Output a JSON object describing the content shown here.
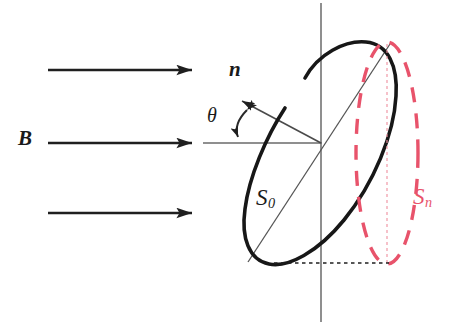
{
  "figure": {
    "background_color": "#ffffff",
    "width": 453,
    "height": 325
  },
  "colors": {
    "stroke_black": "#1a1a1a",
    "stroke_red": "#e8536b",
    "axis_gray": "#5a5a5a",
    "thin_line": "#555555"
  },
  "labels": {
    "field": "B",
    "normal": "n",
    "angle": "θ",
    "area_loop": "S",
    "area_loop_sub": "0",
    "area_projected": "S",
    "area_projected_sub": "n"
  },
  "field_arrows": [
    {
      "name": "field-arrow-top",
      "x1": 48,
      "y1": 70,
      "x2": 205,
      "y2": 70
    },
    {
      "name": "field-arrow-middle",
      "x1": 48,
      "y1": 143,
      "x2": 205,
      "y2": 143
    },
    {
      "name": "field-arrow-bottom",
      "x1": 48,
      "y1": 213,
      "x2": 205,
      "y2": 213
    }
  ],
  "geometry": {
    "center": {
      "x": 321,
      "y": 143
    },
    "vertical_axis": {
      "x": 321,
      "y1": 3,
      "y2": 322
    },
    "b_axis_extension": {
      "x1": 205,
      "y1": 143,
      "x2": 321,
      "y2": 143
    },
    "normal_vector": {
      "x1": 321,
      "y1": 143,
      "x2": 236,
      "y2": 98
    },
    "angle_arc": {
      "cx": 240,
      "cy": 125,
      "r": 22
    },
    "s0_diagonal": {
      "x1": 248,
      "y1": 262,
      "x2": 390,
      "y2": 44
    },
    "loop_black": {
      "type": "tilted-ellipse-open",
      "cx": 321,
      "cy": 153,
      "rx": 46,
      "ry": 118,
      "rotation_deg": 20,
      "gap_note": "open arc, gap at upper-left near (305,78)"
    },
    "loop_red_projection": {
      "type": "dashed-ellipse",
      "cx": 387,
      "cy": 153,
      "rx": 31,
      "ry": 111
    },
    "red_center_dotted_line": {
      "x": 387,
      "y1": 44,
      "y2": 263
    },
    "bottom_dotted_line": {
      "x1": 275,
      "y1": 263,
      "x2": 390,
      "y2": 263
    }
  }
}
